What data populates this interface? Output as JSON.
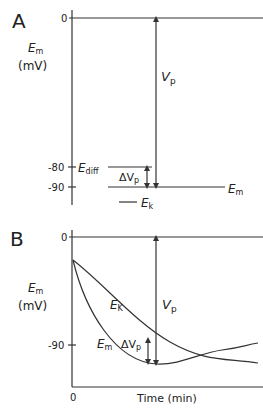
{
  "panel_a": {
    "letter": "A",
    "y_label_main": "E",
    "y_label_sub": "m",
    "y_unit": "(mV)",
    "ticks": [
      {
        "label": "0",
        "value": 0
      },
      {
        "label": "-80",
        "value": -80
      },
      {
        "label": "-90",
        "value": -90
      }
    ],
    "levels": {
      "ediff": {
        "label_main": "E",
        "label_sub": "diff",
        "value": -80
      },
      "em": {
        "label_main": "E",
        "label_sub": "m",
        "value": -90
      },
      "ek": {
        "label_main": "E",
        "label_sub": "k",
        "value": -97
      }
    },
    "vp_label_main": "V",
    "vp_label_sub": "p",
    "dvp_label_main": "ΔV",
    "dvp_label_sub": "p"
  },
  "panel_b": {
    "letter": "B",
    "y_label_main": "E",
    "y_label_sub": "m",
    "y_unit": "(mV)",
    "ticks": [
      {
        "label": "0",
        "value": 0
      },
      {
        "label": "-90",
        "value": -90
      }
    ],
    "x_origin_label": "0",
    "x_label": "Time (min)",
    "curve_ek": {
      "label_main": "E",
      "label_sub": "K"
    },
    "curve_em": {
      "label_main": "E",
      "label_sub": "m"
    },
    "vp_label_main": "V",
    "vp_label_sub": "p",
    "dvp_label_main": "ΔV",
    "dvp_label_sub": "p"
  },
  "colors": {
    "line": "#333333",
    "text": "#222222",
    "background": "#ffffff"
  }
}
